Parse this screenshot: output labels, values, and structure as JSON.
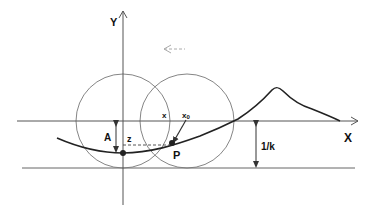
{
  "diagram": {
    "axes": {
      "x_label": "X",
      "y_label": "Y"
    },
    "labels": {
      "amplitude": "A",
      "depth": "z",
      "point": "P",
      "current_x": "x",
      "initial_x": "x",
      "initial_x_subscript": "0",
      "radius": "1/k"
    },
    "colors": {
      "line": "#555555",
      "curve": "#222222",
      "circle": "#777777",
      "dashed_arrow": "#aaaaaa",
      "background": "#ffffff"
    }
  }
}
